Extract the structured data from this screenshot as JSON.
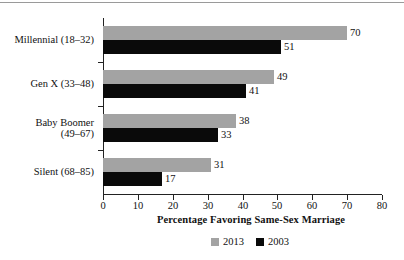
{
  "chart_data": {
    "type": "bar",
    "orientation": "horizontal",
    "title": "",
    "xlabel": "Percentage Favoring Same-Sex Marriage",
    "ylabel": "",
    "xlim": [
      0,
      80
    ],
    "xticks": [
      0,
      10,
      20,
      30,
      40,
      50,
      60,
      70,
      80
    ],
    "xtick_labels": [
      "0",
      "10",
      "20",
      "30",
      "40",
      "50",
      "60",
      "70",
      "80"
    ],
    "grid": false,
    "legend_position": "bottom-center",
    "categories": [
      "Millennial (18–32)",
      "Gen X (33–48)",
      "Baby Boomer\n(49–67)",
      "Silent (68–85)"
    ],
    "series": [
      {
        "name": "2013",
        "color": "#a3a3a3",
        "values": [
          70,
          49,
          38,
          31
        ],
        "value_labels": [
          "70",
          "49",
          "38",
          "31"
        ]
      },
      {
        "name": "2003",
        "color": "#0a0a0a",
        "values": [
          51,
          41,
          33,
          17
        ],
        "value_labels": [
          "51",
          "41",
          "33",
          "17"
        ]
      }
    ],
    "legend": [
      {
        "label": "2013",
        "color": "#a3a3a3"
      },
      {
        "label": "2003",
        "color": "#0a0a0a"
      }
    ]
  }
}
